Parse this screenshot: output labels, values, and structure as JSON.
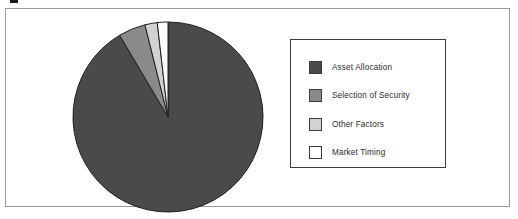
{
  "figure": {
    "background_color": "#ffffff",
    "frame_border_color": "#9a9a9a"
  },
  "legend": {
    "border_color": "#3c3c3c",
    "position": "right",
    "items": [
      {
        "label": "Asset Allocation",
        "color": "#4a4a4a"
      },
      {
        "label": "Selection of Security",
        "color": "#8a8a8a"
      },
      {
        "label": "Other Factors",
        "color": "#d2d2d2"
      },
      {
        "label": "Market Timing",
        "color": "#ffffff"
      }
    ]
  },
  "chart_data": {
    "type": "pie",
    "title": "",
    "xlabel": "",
    "ylabel": "",
    "legend_position": "right",
    "grid": false,
    "start_angle_deg": 0,
    "direction": "clockwise",
    "categories": [
      "Asset Allocation",
      "Selection of Security",
      "Other Factors",
      "Market Timing"
    ],
    "values": [
      91.5,
      4.6,
      2.1,
      1.8
    ],
    "units": "percent",
    "colors": [
      "#4a4a4a",
      "#8a8a8a",
      "#d2d2d2",
      "#ffffff"
    ],
    "slice_border_color": "#1f1f1f",
    "data_labels_shown": false
  }
}
